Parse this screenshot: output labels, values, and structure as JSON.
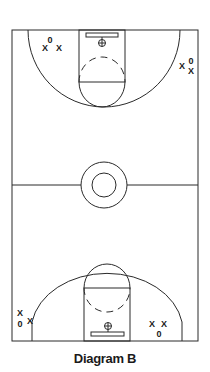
{
  "caption": "Diagram B",
  "legend": {
    "offense_symbol": "O",
    "defense_symbol": "X"
  },
  "top_half": {
    "left_group": [
      "0",
      "X",
      "X"
    ],
    "right_group": [
      "X",
      "0",
      "X"
    ]
  },
  "bottom_half": {
    "left_group": [
      "X",
      "0",
      "X"
    ],
    "right_group": [
      "X",
      "X",
      "0"
    ]
  },
  "colors": {
    "lines": "#2a2a2a",
    "background": "#ffffff",
    "text": "#1a1a1a"
  }
}
